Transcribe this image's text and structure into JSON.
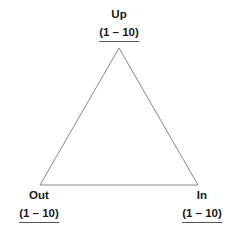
{
  "diagram": {
    "type": "triangle-vertex-labels",
    "background_color": "#ffffff",
    "stroke_color": "#888888",
    "text_color": "#1a1a1a",
    "underline_color": "#555555",
    "vertices": [
      {
        "id": "up",
        "label": "Up",
        "range": "(1 – 10)",
        "position": "top"
      },
      {
        "id": "out",
        "label": "Out",
        "range": "(1 – 10)",
        "position": "bottom-left"
      },
      {
        "id": "in",
        "label": "In",
        "range": "(1 – 10)",
        "position": "bottom-right"
      }
    ],
    "shape": {
      "apex_x": 119,
      "apex_y": 48,
      "bottom_left_x": 40,
      "bottom_left_y": 185,
      "bottom_right_x": 198,
      "bottom_right_y": 185
    }
  }
}
